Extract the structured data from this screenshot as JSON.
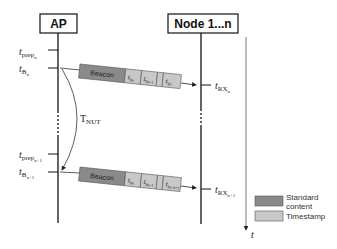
{
  "diagram": {
    "entities": [
      {
        "label": "AP"
      },
      {
        "label": "Node 1...n"
      }
    ],
    "ap_labels": [
      {
        "main": "t",
        "sub": "prep",
        "subsub": "n"
      },
      {
        "main": "t",
        "sub": "B",
        "subsub": "n"
      },
      {
        "main": "t",
        "sub": "prep",
        "subsub": "n+1"
      },
      {
        "main": "t",
        "sub": "B",
        "subsub": "n+1"
      }
    ],
    "node_labels": [
      {
        "main": "t",
        "sub": "RX",
        "subsub": "n"
      },
      {
        "main": "t",
        "sub": "RX",
        "subsub": "n+1"
      }
    ],
    "interval": {
      "main": "T",
      "sub": "NUT"
    },
    "packets": [
      {
        "beacon_label": "Beacon",
        "timestamps": [
          "t",
          "t",
          "t"
        ],
        "timestamp_subs": [
          "Bn",
          "Bn-1",
          "B1"
        ]
      },
      {
        "beacon_label": "Beacon",
        "timestamps": [
          "t",
          "t",
          "t"
        ],
        "timestamp_subs": [
          "Bn",
          "Bn-1",
          "Bn-k+1"
        ]
      }
    ],
    "time_axis_label": "t",
    "legend": [
      {
        "label_line1": "Standard",
        "label_line2": "content",
        "color": "#8a8a8a"
      },
      {
        "label_line1": "Timestamp",
        "label_line2": "",
        "color": "#c8c8c8"
      }
    ]
  }
}
